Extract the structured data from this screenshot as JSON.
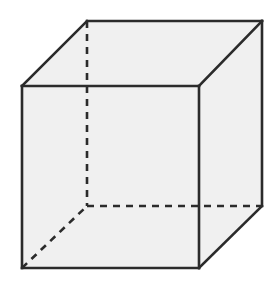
{
  "figure": {
    "kind": "3d-wireframe-cube",
    "canvas": {
      "width": 280,
      "height": 286,
      "background_color": "#ffffff"
    },
    "style": {
      "face_fill_color": "#f0f0f0",
      "edge_color": "#2b2b2b",
      "edge_width": 2.6,
      "hidden_edge_dash_pattern": "7 6"
    },
    "vertices": {
      "front_top_left": {
        "label": "front-top-left",
        "x": 22,
        "y": 86,
        "hidden": false
      },
      "front_top_right": {
        "label": "front-top-right",
        "x": 199,
        "y": 86,
        "hidden": false
      },
      "front_bottom_right": {
        "label": "front-bottom-right",
        "x": 199,
        "y": 268,
        "hidden": false
      },
      "front_bottom_left": {
        "label": "front-bottom-left",
        "x": 22,
        "y": 268,
        "hidden": false
      },
      "back_top_left": {
        "label": "back-top-left",
        "x": 87,
        "y": 21,
        "hidden": false
      },
      "back_top_right": {
        "label": "back-top-right",
        "x": 262,
        "y": 21,
        "hidden": false
      },
      "back_bottom_right": {
        "label": "back-bottom-right",
        "x": 262,
        "y": 206,
        "hidden": false
      },
      "back_bottom_left": {
        "label": "back-bottom-left",
        "x": 87,
        "y": 206,
        "hidden": true
      }
    },
    "faces": {
      "front": {
        "label": "front face",
        "points": "22,86 199,86 199,268 22,268"
      },
      "top": {
        "label": "top face",
        "points": "22,86 87,21 262,21 199,86"
      },
      "right": {
        "label": "right face",
        "points": "199,86 262,21 262,206 199,268"
      },
      "silhouette": {
        "label": "cube silhouette",
        "points": "22,86 87,21 262,21 262,206 199,268 22,268"
      }
    },
    "edges_visible": {
      "front_top": {
        "label": "front top edge",
        "d": "M22,86 L199,86"
      },
      "front_right": {
        "label": "front right edge",
        "d": "M199,86 L199,268"
      },
      "front_bottom": {
        "label": "front bottom edge",
        "d": "M199,268 L22,268"
      },
      "front_left": {
        "label": "front left edge",
        "d": "M22,268 L22,86"
      },
      "top_left_diagonal": {
        "label": "top left receding edge",
        "d": "M22,86 L87,21"
      },
      "back_top": {
        "label": "back top edge",
        "d": "M87,21 L262,21"
      },
      "top_right_diagonal": {
        "label": "top right receding edge",
        "d": "M199,86 L262,21"
      },
      "back_right": {
        "label": "back right vertical edge",
        "d": "M262,21 L262,206"
      },
      "bottom_right_diagonal": {
        "label": "bottom right receding edge",
        "d": "M199,268 L262,206"
      }
    },
    "edges_hidden": {
      "back_left_vertical": {
        "label": "hidden back left vertical edge",
        "d": "M87,21 L87,206"
      },
      "back_bottom": {
        "label": "hidden back bottom edge",
        "d": "M87,206 L262,206"
      },
      "bottom_left_diagonal": {
        "label": "hidden bottom left receding edge",
        "d": "M22,268 L87,206"
      }
    }
  }
}
